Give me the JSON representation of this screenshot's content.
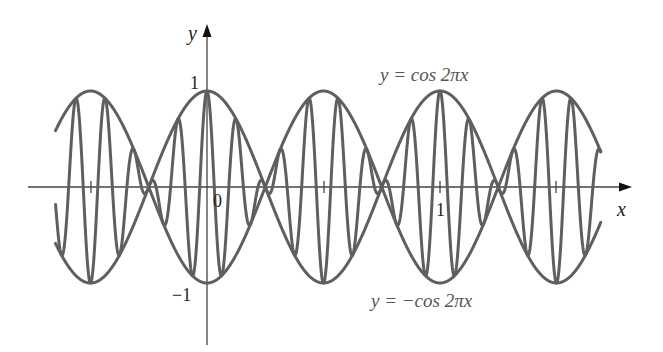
{
  "chart_data": {
    "type": "line",
    "title": "",
    "xlabel": "x",
    "ylabel": "y",
    "xlim": [
      -0.65,
      1.69
    ],
    "ylim": [
      -1,
      1
    ],
    "grid": false,
    "x_ticks": [
      -0.5,
      0,
      0.5,
      1,
      1.5
    ],
    "x_tick_labels": {
      "0": "0",
      "1": "1"
    },
    "y_tick_labels": {
      "1": "1",
      "-1": "−1"
    },
    "series": [
      {
        "name": "y = cos 2πx",
        "expr": "cos(2*pi*x)",
        "role": "upper envelope",
        "x_range": [
          -0.65,
          1.69
        ]
      },
      {
        "name": "y = −cos 2πx",
        "expr": "-cos(2*pi*x)",
        "role": "lower envelope",
        "x_range": [
          -0.65,
          1.69
        ]
      },
      {
        "name": "modulated wave",
        "expr": "cos(2*pi*x)*cos(16*pi*x)",
        "role": "oscillating curve between envelopes",
        "x_range": [
          -0.65,
          1.69
        ]
      }
    ],
    "annotations": [
      {
        "text": "y = cos 2πx",
        "near": "upper envelope, above peak at x=1"
      },
      {
        "text": "y = −cos 2πx",
        "near": "lower envelope, below trough at x=0.5"
      }
    ]
  },
  "labels": {
    "x_axis": "x",
    "y_axis": "y",
    "origin": "0",
    "x_one": "1",
    "y_one": "1",
    "y_neg_one": "−1",
    "upper_curve_pre": "y = cos 2",
    "upper_curve_pi": "π",
    "upper_curve_post": "x",
    "lower_curve_pre": "y = −cos 2",
    "lower_curve_pi": "π",
    "lower_curve_post": "x"
  },
  "style": {
    "curve_color": "#5f5f5f",
    "axis_color": "#444444",
    "label_color": "#555555"
  }
}
